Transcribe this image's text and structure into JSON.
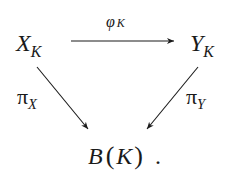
{
  "diagram": {
    "type": "commutative-triangle",
    "nodes": {
      "top_left": {
        "base": "X",
        "sub": "K"
      },
      "top_right": {
        "base": "Y",
        "sub": "K"
      },
      "bottom": {
        "base": "B",
        "open": "(",
        "arg": "K",
        "close": ")",
        "trailing": "."
      }
    },
    "arrows": {
      "top": {
        "from": "X_K",
        "to": "Y_K",
        "label_base": "φ",
        "label_sub": "K"
      },
      "left": {
        "from": "X_K",
        "to": "B(K)",
        "label_base": "π",
        "label_sub": "X"
      },
      "right": {
        "from": "Y_K",
        "to": "B(K)",
        "label_base": "π",
        "label_sub": "Y"
      }
    },
    "colors": {
      "ink": "#1a1a1a",
      "background": "#ffffff"
    }
  }
}
